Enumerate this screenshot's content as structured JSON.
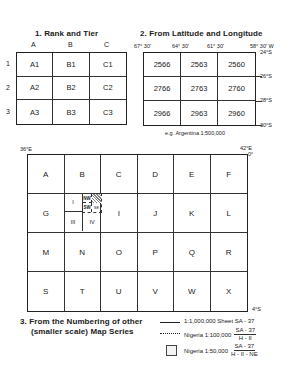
{
  "section1": {
    "title": "1. Rank and Tier",
    "columns": [
      "A",
      "B",
      "C"
    ],
    "rows": [
      "1",
      "2",
      "3"
    ],
    "cells": [
      [
        "A1",
        "B1",
        "C1"
      ],
      [
        "A2",
        "B2",
        "C2"
      ],
      [
        "A3",
        "B3",
        "C3"
      ]
    ]
  },
  "section2": {
    "title": "2. From Latitude and Longitude",
    "longitudes": [
      "67° 30'",
      "64° 30'",
      "61° 30'",
      "58° 30' W"
    ],
    "latitudes": [
      "24°S",
      "26°S",
      "28°S",
      "30°S"
    ],
    "cells": [
      [
        "2566",
        "2563",
        "2560"
      ],
      [
        "2766",
        "2763",
        "2760"
      ],
      [
        "2966",
        "2963",
        "2960"
      ]
    ],
    "caption": "e.g. Argentina 1:500,000"
  },
  "section3": {
    "title_line1": "3. From the Numbering of other",
    "title_line2": "(smaller scale) Map Series",
    "corner_top_left": "36°E",
    "corner_top_right_lon": "42°E",
    "corner_top_right_lat": "0°",
    "corner_bottom_right": "4°S",
    "cells": [
      [
        "A",
        "B",
        "C",
        "D",
        "E",
        "F"
      ],
      [
        "G",
        "",
        "I",
        "J",
        "K",
        "L"
      ],
      [
        "M",
        "N",
        "O",
        "P",
        "Q",
        "R"
      ],
      [
        "S",
        "T",
        "U",
        "V",
        "W",
        "X"
      ]
    ],
    "subdivision": {
      "quadrants": [
        "I",
        "II",
        "III",
        "IV"
      ],
      "sub_quadrants": [
        "NW",
        "NE",
        "SW",
        "SE"
      ]
    },
    "legend": [
      {
        "line": "solid",
        "label": "1:1,000,000 Sheet SA - 37"
      },
      {
        "line": "dotted",
        "label": "Nigeria 1:100,000",
        "frac_num": "SA - 37",
        "frac_den": "H - II"
      },
      {
        "line": "box",
        "label": "Nigeria 1:50,000",
        "frac_num": "SA - 37",
        "frac_den": "H - II - NE"
      }
    ]
  }
}
